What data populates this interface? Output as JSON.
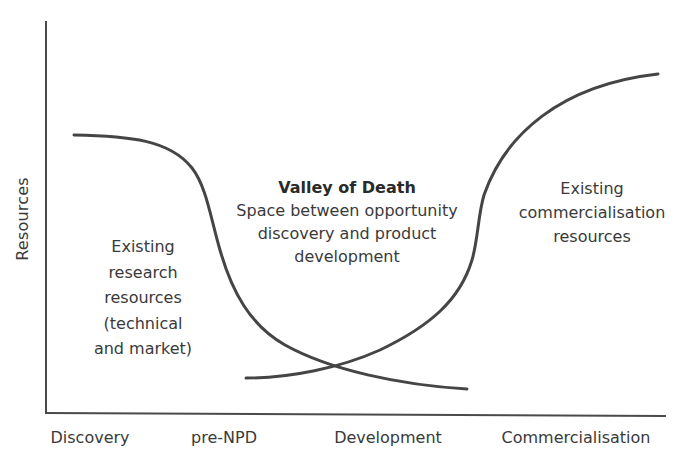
{
  "diagram": {
    "type": "conceptual-curve-diagram",
    "y_axis_label": "Resources",
    "x_axis_labels": [
      "Discovery",
      "pre-NPD",
      "Development",
      "Commercialisation"
    ],
    "left_region": {
      "lines": [
        "Existing",
        "research",
        "resources",
        "(technical",
        "and market)"
      ]
    },
    "valley": {
      "title": "Valley of Death",
      "lines": [
        "Space between opportunity",
        "discovery and product",
        "development"
      ]
    },
    "right_region": {
      "lines": [
        "Existing",
        "commercialisation",
        "resources"
      ]
    },
    "curves": [
      {
        "name": "research-resources-curve",
        "description": "Starts high on left, drops sharply through pre-NPD, flattens low by Development"
      },
      {
        "name": "commercialisation-resources-curve",
        "description": "Starts low at pre-NPD/Development boundary, rises steeply, plateaus high at Commercialisation"
      }
    ],
    "colors": {
      "line": "#454545",
      "text": "#3a3a3a",
      "background": "#ffffff"
    }
  }
}
